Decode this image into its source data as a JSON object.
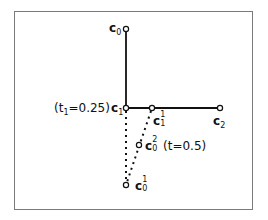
{
  "diagram": {
    "type": "de-casteljau-construction",
    "points": {
      "c0": {
        "label": "c",
        "sub": "0",
        "sup": "",
        "x": 126,
        "y": 29
      },
      "c1": {
        "label": "c",
        "sub": "1",
        "sup": "",
        "x": 126,
        "y": 108
      },
      "c2": {
        "label": "c",
        "sub": "2",
        "sup": "",
        "x": 220,
        "y": 108
      },
      "c11": {
        "label": "c",
        "sub": "1",
        "sup": "1",
        "x": 152,
        "y": 108
      },
      "c02": {
        "label": "c",
        "sub": "0",
        "sup": "2",
        "x": 139,
        "y": 145
      },
      "c01": {
        "label": "c",
        "sub": "0",
        "sup": "1",
        "x": 126,
        "y": 185
      }
    },
    "solid_edges": [
      [
        "c0",
        "c1"
      ],
      [
        "c1",
        "c2"
      ]
    ],
    "dotted_edges": [
      [
        "c1",
        "c01"
      ],
      [
        "c11",
        "c01"
      ]
    ],
    "annotations": {
      "t1": {
        "prefix": "(t",
        "sub": "1",
        "suffix": "=0.25)"
      },
      "t": {
        "text": "(t=0.5)"
      }
    },
    "colors": {
      "stroke": "#111111",
      "frame": "#7a7a7a"
    }
  }
}
